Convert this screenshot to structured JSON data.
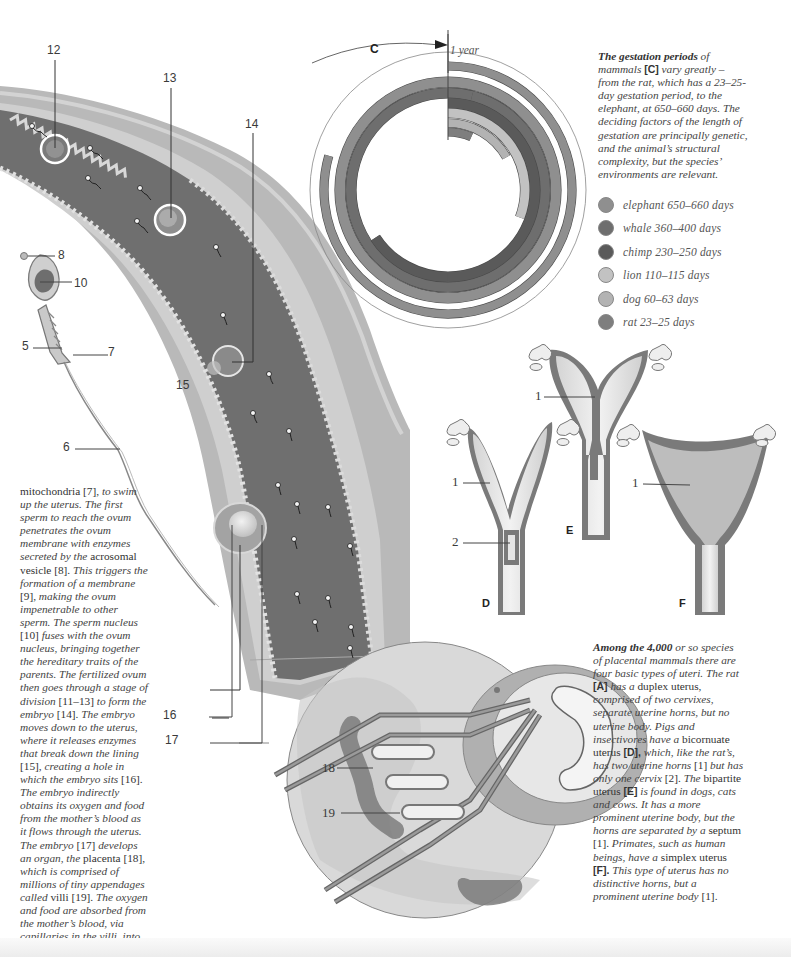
{
  "chart_data": {
    "type": "radial-bar",
    "label": "C",
    "scale_marker": "1 year",
    "scale_days": 365,
    "series": [
      {
        "name": "elephant",
        "min_days": 650,
        "max_days": 660,
        "label": "elephant  650–660 days",
        "color": "#8f8f8f"
      },
      {
        "name": "whale",
        "min_days": 360,
        "max_days": 400,
        "label": "whale  360–400 days",
        "color": "#6e6e6e"
      },
      {
        "name": "chimp",
        "min_days": 230,
        "max_days": 250,
        "label": "chimp  230–250 days",
        "color": "#5a5a5a"
      },
      {
        "name": "lion",
        "min_days": 110,
        "max_days": 115,
        "label": "lion  110–115 days",
        "color": "#c2c2c2"
      },
      {
        "name": "dog",
        "min_days": 60,
        "max_days": 63,
        "label": "dog  60–63 days",
        "color": "#b3b3b3"
      },
      {
        "name": "rat",
        "min_days": 23,
        "max_days": 25,
        "label": "rat  23–25 days",
        "color": "#7e7e7e"
      }
    ]
  },
  "gestation_caption": {
    "lead_bold": "The gestation periods",
    "t1": " of mammals ",
    "ref": "[C]",
    "t2": " vary greatly – from the rat, which has a 23–25-day gestation period, to the elephant, at 650–660 days. The deciding factors of the length of gestation are principally genetic, and the animal’s structural complexity, but the species’ environments are relevant."
  },
  "fertilization_text": {
    "p1_up": "mitochondria [7],",
    "p1_it": " to swim up the uterus. The first sperm to reach the ovum penetrates the ovum membrane with enzymes secreted by the ",
    "p2_up": "acrosomal vesicle [8].",
    "p2_it": " This triggers the formation of a ",
    "p3_it": "membrane",
    "p3_up": " [9],",
    "p4_it": " making the ovum impenetrable to other sperm. The sperm nucleus ",
    "p5_up": "[10]",
    "p5_it": " fuses with the ovum nucleus, bringing together the hereditary traits of the parents. The fertilized ovum then goes through a stage of division ",
    "p6_up": "[11–13]",
    "p6_it": " to form the embryo ",
    "p7_up": "[14].",
    "p7_it": " The embryo moves down to the uterus, where it releases enzymes that break down the lining ",
    "p8_up": "[15],",
    "p8_it": " creating a hole in which the embryo sits ",
    "p9_up": "[16].",
    "p9_it": " The embryo indirectly obtains its oxygen and food from the mother’s blood as it flows through the uterus. The embryo ",
    "p10_up": "[17]",
    "p10_it": " develops an organ, the ",
    "p11_up": "placenta [18],",
    "p11_it": " which is comprised of millions of tiny appendages called ",
    "p12_up": "villi [19].",
    "p12_it": " The oxygen and food are absorbed from the mother’s blood, via capillaries in the villi, into the embryo’s blood."
  },
  "uteri_text": {
    "lead_bold": "Among the 4,000",
    "t1": " or so species of placental mammals there are four basic types of uteri. The rat ",
    "refA": "[A]",
    "t2": " has a ",
    "u1": "duplex uterus,",
    "t3": " comprised of two cervixes, separate uterine horns, but no uterine body. Pigs and insectivores have a ",
    "u2": "bicornuate uterus ",
    "refD": "[D],",
    "t4": " which, like the rat’s, has two uterine horns ",
    "u3": "[1]",
    "t5": " but has only one cervix ",
    "u4": "[2].",
    "t6": " The ",
    "u5": "bipartite uterus ",
    "refE": "[E]",
    "t7": " is found in dogs, cats and cows. It has a more prominent uterine body, but the horns are separated by a ",
    "u6": "septum [1].",
    "t8": " Primates, such as human beings, have a ",
    "u7": "simplex uterus ",
    "refF": "[F].",
    "t9": " This type of uterus has no distinctive horns, but a prominent uterine body ",
    "u8": "[1]."
  },
  "callouts": {
    "n5": "5",
    "n6": "6",
    "n7": "7",
    "n8": "8",
    "n10": "10",
    "n12": "12",
    "n13": "13",
    "n14": "14",
    "n15": "15",
    "n16": "16",
    "n17": "17",
    "n18": "18",
    "n19": "19"
  },
  "uteri_diagram": {
    "label_D": "D",
    "label_E": "E",
    "label_F": "F",
    "d_horn": "1",
    "d_cervix": "2",
    "e_septum": "1",
    "f_body": "1"
  }
}
